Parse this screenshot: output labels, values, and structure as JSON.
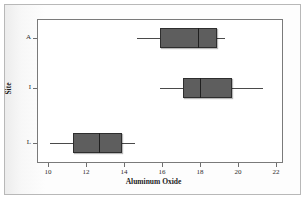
{
  "figure": {
    "xlabel": "Aluminum Oxide",
    "ylabel": "Site"
  },
  "axis": {
    "x_ticks": [
      "10",
      "12",
      "14",
      "16",
      "18",
      "20",
      "22"
    ],
    "y_ticks": [
      "A",
      "I",
      "L"
    ]
  },
  "colors": {
    "box_fill": "#5e5e5e",
    "box_edge": "#2e2e2e",
    "median": "#1f1f1f",
    "whisker": "#4a4a4a",
    "panel_bg": "#ffffff",
    "panel_edge": "#7a7a7a",
    "page_bg": "#fbfbfb"
  },
  "chart_data": {
    "type": "box",
    "orientation": "horizontal",
    "title": "",
    "xlabel": "Aluminum Oxide",
    "ylabel": "Site",
    "xlim": [
      9.0,
      22.5
    ],
    "xticks": [
      10,
      12,
      14,
      16,
      18,
      20,
      22
    ],
    "grid": false,
    "legend": false,
    "categories": [
      "A",
      "I",
      "L"
    ],
    "boxes": [
      {
        "category": "A",
        "whisker_low": 14.7,
        "q1": 15.9,
        "median": 17.9,
        "q3": 18.9,
        "whisker_high": 19.3
      },
      {
        "category": "I",
        "whisker_low": 15.9,
        "q1": 17.1,
        "median": 18.0,
        "q3": 19.7,
        "whisker_high": 21.3
      },
      {
        "category": "L",
        "whisker_low": 10.1,
        "q1": 11.3,
        "median": 12.7,
        "q3": 13.9,
        "whisker_high": 14.6
      }
    ]
  }
}
